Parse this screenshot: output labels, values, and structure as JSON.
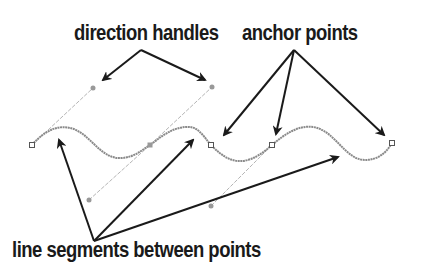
{
  "labels": {
    "direction_handles": "direction handles",
    "anchor_points": "anchor points",
    "line_segments": "line segments between points"
  },
  "colors": {
    "text": "#1a1a1a",
    "arrow": "#1a1a1a",
    "curve": "#8a8a8a",
    "handle_line": "#b5b5b5",
    "handle_point": "#999999",
    "anchor_stroke": "#555555"
  },
  "diagram": {
    "anchors": [
      {
        "x": 32,
        "y": 145,
        "type": "endpoint"
      },
      {
        "x": 150,
        "y": 145,
        "type": "selected"
      },
      {
        "x": 211,
        "y": 145,
        "type": "anchor"
      },
      {
        "x": 272,
        "y": 145,
        "type": "anchor"
      },
      {
        "x": 392,
        "y": 143,
        "type": "endpoint"
      }
    ],
    "direction_handles": [
      {
        "from": [
          93,
          88
        ],
        "to": [
          150,
          145
        ]
      },
      {
        "from": [
          89,
          200
        ],
        "to": [
          150,
          145
        ]
      },
      {
        "from": [
          212,
          87
        ],
        "to": [
          150,
          145
        ]
      },
      {
        "from": [
          211,
          206
        ],
        "to": [
          272,
          145
        ]
      }
    ]
  }
}
